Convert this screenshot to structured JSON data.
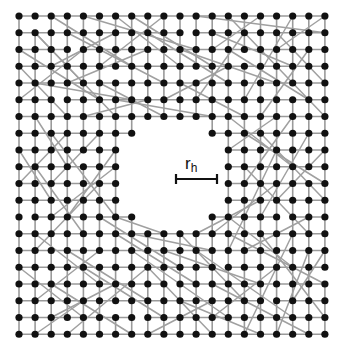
{
  "figure": {
    "colors": {
      "node": "#111111",
      "edge": "#9a9a9a",
      "background": "#ffffff",
      "scale_bar": "#111111"
    },
    "grid": {
      "cols": 20,
      "rows": 20,
      "x0": 19,
      "y0": 16,
      "dx": 16.1,
      "dy": 16.75,
      "node_radius": 3.6
    },
    "hole": {
      "missing_nodes": [
        [
          8,
          7
        ],
        [
          9,
          7
        ],
        [
          10,
          7
        ],
        [
          11,
          7
        ],
        [
          7,
          8
        ],
        [
          8,
          8
        ],
        [
          9,
          8
        ],
        [
          10,
          8
        ],
        [
          11,
          8
        ],
        [
          12,
          8
        ],
        [
          7,
          9
        ],
        [
          8,
          9
        ],
        [
          9,
          9
        ],
        [
          10,
          9
        ],
        [
          11,
          9
        ],
        [
          12,
          9
        ],
        [
          7,
          10
        ],
        [
          8,
          10
        ],
        [
          9,
          10
        ],
        [
          10,
          10
        ],
        [
          11,
          10
        ],
        [
          12,
          10
        ],
        [
          7,
          11
        ],
        [
          8,
          11
        ],
        [
          9,
          11
        ],
        [
          10,
          11
        ],
        [
          11,
          11
        ],
        [
          12,
          11
        ],
        [
          8,
          12
        ],
        [
          9,
          12
        ],
        [
          10,
          12
        ],
        [
          11,
          12
        ]
      ]
    },
    "scale_bar": {
      "label_main": "r",
      "label_sub": "h",
      "x1": 176,
      "x2": 217,
      "y": 179,
      "tick": 5,
      "label_x": 185,
      "label_y": 155
    },
    "removed_grid_edges": [
      [
        [
          1,
          0
        ],
        [
          1,
          1
        ]
      ],
      [
        [
          3,
          2
        ],
        [
          4,
          2
        ]
      ],
      [
        [
          6,
          3
        ],
        [
          6,
          4
        ]
      ],
      [
        [
          10,
          1
        ],
        [
          11,
          1
        ]
      ],
      [
        [
          14,
          2
        ],
        [
          14,
          3
        ]
      ],
      [
        [
          2,
          5
        ],
        [
          3,
          5
        ]
      ],
      [
        [
          17,
          4
        ],
        [
          17,
          5
        ]
      ],
      [
        [
          5,
          14
        ],
        [
          5,
          15
        ]
      ],
      [
        [
          9,
          16
        ],
        [
          10,
          16
        ]
      ],
      [
        [
          15,
          17
        ],
        [
          16,
          17
        ]
      ],
      [
        [
          3,
          18
        ],
        [
          3,
          19
        ]
      ],
      [
        [
          12,
          15
        ],
        [
          13,
          15
        ]
      ],
      [
        [
          18,
          9
        ],
        [
          18,
          10
        ]
      ],
      [
        [
          0,
          12
        ],
        [
          1,
          12
        ]
      ],
      [
        [
          7,
          18
        ],
        [
          8,
          18
        ]
      ],
      [
        [
          16,
          12
        ],
        [
          17,
          12
        ]
      ],
      [
        [
          4,
          8
        ],
        [
          4,
          9
        ]
      ],
      [
        [
          11,
          3
        ],
        [
          11,
          4
        ]
      ],
      [
        [
          19,
          15
        ],
        [
          19,
          16
        ]
      ],
      [
        [
          6,
          17
        ],
        [
          6,
          18
        ]
      ]
    ],
    "long_range_edges": [
      [
        [
          1,
          1
        ],
        [
          6,
          6
        ]
      ],
      [
        [
          1,
          1
        ],
        [
          4,
          4
        ]
      ],
      [
        [
          0,
          2
        ],
        [
          5,
          5
        ]
      ],
      [
        [
          2,
          0
        ],
        [
          7,
          3
        ]
      ],
      [
        [
          3,
          1
        ],
        [
          9,
          4
        ]
      ],
      [
        [
          4,
          0
        ],
        [
          11,
          2
        ]
      ],
      [
        [
          6,
          0
        ],
        [
          10,
          3
        ]
      ],
      [
        [
          8,
          1
        ],
        [
          13,
          4
        ]
      ],
      [
        [
          7,
          0
        ],
        [
          12,
          3
        ]
      ],
      [
        [
          9,
          0
        ],
        [
          5,
          3
        ]
      ],
      [
        [
          11,
          0
        ],
        [
          19,
          1
        ]
      ],
      [
        [
          12,
          1
        ],
        [
          17,
          3
        ]
      ],
      [
        [
          13,
          0
        ],
        [
          19,
          6
        ]
      ],
      [
        [
          14,
          1
        ],
        [
          11,
          5
        ]
      ],
      [
        [
          15,
          0
        ],
        [
          12,
          2
        ]
      ],
      [
        [
          16,
          1
        ],
        [
          19,
          4
        ]
      ],
      [
        [
          17,
          0
        ],
        [
          14,
          5
        ]
      ],
      [
        [
          18,
          2
        ],
        [
          15,
          6
        ]
      ],
      [
        [
          13,
          2
        ],
        [
          18,
          5
        ]
      ],
      [
        [
          10,
          2
        ],
        [
          16,
          4
        ]
      ],
      [
        [
          2,
          3
        ],
        [
          6,
          1
        ]
      ],
      [
        [
          0,
          5
        ],
        [
          4,
          2
        ]
      ],
      [
        [
          1,
          6
        ],
        [
          3,
          9
        ]
      ],
      [
        [
          0,
          8
        ],
        [
          2,
          11
        ]
      ],
      [
        [
          2,
          7
        ],
        [
          6,
          12
        ]
      ],
      [
        [
          1,
          9
        ],
        [
          4,
          13
        ]
      ],
      [
        [
          0,
          10
        ],
        [
          3,
          7
        ]
      ],
      [
        [
          2,
          12
        ],
        [
          6,
          9
        ]
      ],
      [
        [
          1,
          13
        ],
        [
          5,
          16
        ]
      ],
      [
        [
          0,
          15
        ],
        [
          4,
          18
        ]
      ],
      [
        [
          3,
          14
        ],
        [
          8,
          17
        ]
      ],
      [
        [
          2,
          16
        ],
        [
          7,
          19
        ]
      ],
      [
        [
          1,
          17
        ],
        [
          5,
          14
        ]
      ],
      [
        [
          4,
          15
        ],
        [
          9,
          18
        ]
      ],
      [
        [
          3,
          19
        ],
        [
          8,
          15
        ]
      ],
      [
        [
          6,
          13
        ],
        [
          11,
          16
        ]
      ],
      [
        [
          7,
          14
        ],
        [
          13,
          18
        ]
      ],
      [
        [
          9,
          14
        ],
        [
          15,
          16
        ]
      ],
      [
        [
          10,
          13
        ],
        [
          14,
          17
        ]
      ],
      [
        [
          8,
          15
        ],
        [
          12,
          19
        ]
      ],
      [
        [
          11,
          14
        ],
        [
          17,
          18
        ]
      ],
      [
        [
          12,
          16
        ],
        [
          18,
          19
        ]
      ],
      [
        [
          13,
          13
        ],
        [
          19,
          16
        ]
      ],
      [
        [
          14,
          14
        ],
        [
          18,
          12
        ]
      ],
      [
        [
          15,
          13
        ],
        [
          19,
          18
        ]
      ],
      [
        [
          16,
          15
        ],
        [
          12,
          18
        ]
      ],
      [
        [
          17,
          13
        ],
        [
          14,
          19
        ]
      ],
      [
        [
          18,
          14
        ],
        [
          16,
          19
        ]
      ],
      [
        [
          13,
          12
        ],
        [
          17,
          15
        ]
      ],
      [
        [
          14,
          9
        ],
        [
          18,
          13
        ]
      ],
      [
        [
          15,
          7
        ],
        [
          19,
          11
        ]
      ],
      [
        [
          16,
          8
        ],
        [
          13,
          14
        ]
      ],
      [
        [
          17,
          6
        ],
        [
          14,
          10
        ]
      ],
      [
        [
          18,
          7
        ],
        [
          15,
          12
        ]
      ],
      [
        [
          19,
          8
        ],
        [
          16,
          11
        ]
      ],
      [
        [
          13,
          6
        ],
        [
          17,
          9
        ]
      ],
      [
        [
          14,
          7
        ],
        [
          19,
          10
        ]
      ],
      [
        [
          5,
          4
        ],
        [
          9,
          6
        ]
      ],
      [
        [
          6,
          5
        ],
        [
          12,
          6
        ]
      ],
      [
        [
          4,
          6
        ],
        [
          8,
          5
        ]
      ],
      [
        [
          5,
          7
        ],
        [
          2,
          10
        ]
      ],
      [
        [
          6,
          8
        ],
        [
          3,
          12
        ]
      ],
      [
        [
          5,
          10
        ],
        [
          1,
          14
        ]
      ],
      [
        [
          6,
          12
        ],
        [
          9,
          13
        ]
      ],
      [
        [
          7,
          13
        ],
        [
          12,
          14
        ]
      ],
      [
        [
          5,
          12
        ],
        [
          10,
          15
        ]
      ],
      [
        [
          11,
          13
        ],
        [
          15,
          11
        ]
      ],
      [
        [
          12,
          13
        ],
        [
          16,
          10
        ]
      ],
      [
        [
          13,
          8
        ],
        [
          16,
          6
        ]
      ],
      [
        [
          3,
          4
        ],
        [
          8,
          2
        ]
      ],
      [
        [
          1,
          4
        ],
        [
          7,
          5
        ]
      ],
      [
        [
          0,
          3
        ],
        [
          3,
          6
        ]
      ],
      [
        [
          10,
          4
        ],
        [
          14,
          6
        ]
      ],
      [
        [
          9,
          5
        ],
        [
          13,
          3
        ]
      ],
      [
        [
          2,
          18
        ],
        [
          6,
          16
        ]
      ],
      [
        [
          10,
          17
        ],
        [
          15,
          19
        ]
      ],
      [
        [
          8,
          19
        ],
        [
          12,
          17
        ]
      ],
      [
        [
          4,
          17
        ],
        [
          1,
          19
        ]
      ],
      [
        [
          17,
          17
        ],
        [
          19,
          14
        ]
      ],
      [
        [
          16,
          2
        ],
        [
          19,
          0
        ]
      ]
    ]
  }
}
